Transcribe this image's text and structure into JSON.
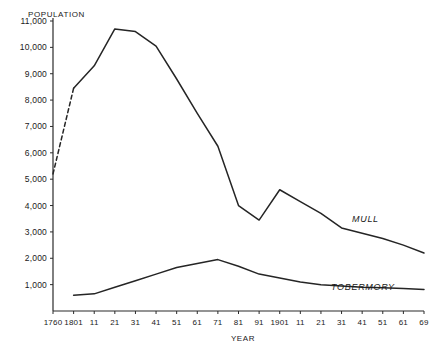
{
  "chart_data": {
    "type": "line",
    "title": "",
    "xlabel": "YEAR",
    "ylabel": "POPULATION",
    "xlim": [
      1760,
      1969
    ],
    "ylim": [
      0,
      11000
    ],
    "grid": false,
    "legend_position": "inline-right",
    "ytick_labels": [
      "11,000",
      "10,000",
      "9,000",
      "8,000",
      "7,000",
      "6,000",
      "5,000",
      "4,000",
      "3,000",
      "2,000",
      "1,000"
    ],
    "ytick_values": [
      11000,
      10000,
      9000,
      8000,
      7000,
      6000,
      5000,
      4000,
      3000,
      2000,
      1000
    ],
    "xtick_labels": [
      "1760",
      "1801",
      "11",
      "21",
      "31",
      "41",
      "51",
      "61",
      "71",
      "81",
      "91",
      "1901",
      "11",
      "21",
      "31",
      "41",
      "51",
      "61",
      "69"
    ],
    "xtick_values": [
      1760,
      1801,
      1811,
      1821,
      1831,
      1841,
      1851,
      1861,
      1871,
      1881,
      1891,
      1901,
      1911,
      1921,
      1931,
      1941,
      1951,
      1961,
      1969
    ],
    "series": [
      {
        "name": "MULL",
        "label": "MULL",
        "x": [
          1760,
          1801,
          1811,
          1821,
          1831,
          1841,
          1851,
          1861,
          1871,
          1881,
          1891,
          1901,
          1911,
          1921,
          1931,
          1941,
          1951,
          1961,
          1969
        ],
        "values": [
          5200,
          8450,
          9300,
          10700,
          10600,
          10050,
          8800,
          7500,
          6250,
          4000,
          3450,
          4600,
          4150,
          3700,
          3150,
          2950,
          2750,
          2500,
          2200
        ],
        "dashed_segment": {
          "from": 1760,
          "to": 1801
        }
      },
      {
        "name": "TOBERMORY",
        "label": "TOBERMORY",
        "x": [
          1801,
          1811,
          1821,
          1831,
          1841,
          1851,
          1861,
          1871,
          1881,
          1891,
          1901,
          1911,
          1921,
          1931,
          1941,
          1951,
          1961,
          1969
        ],
        "values": [
          600,
          650,
          900,
          1150,
          1400,
          1650,
          1800,
          1950,
          1700,
          1400,
          1250,
          1100,
          1000,
          950,
          900,
          880,
          850,
          820
        ]
      }
    ]
  }
}
